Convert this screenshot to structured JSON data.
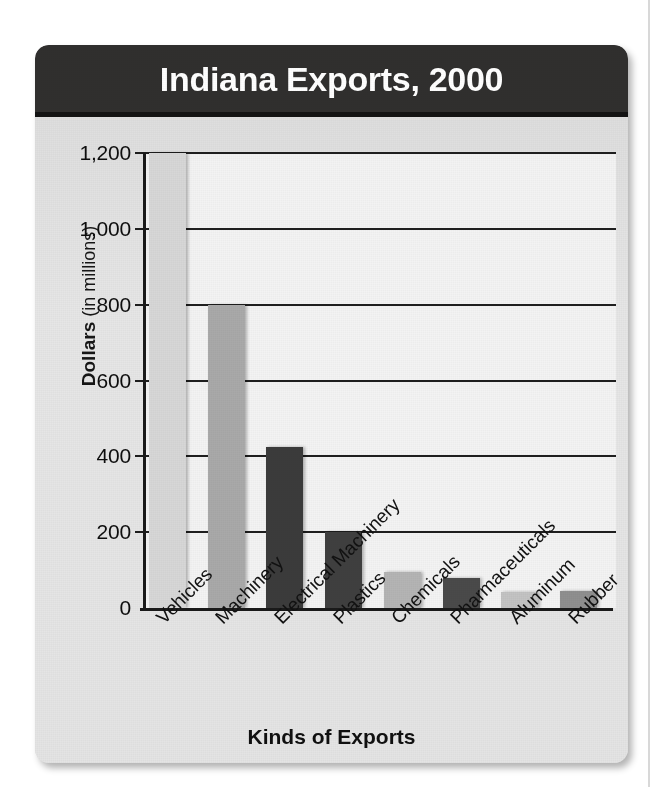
{
  "card": {
    "title": "Indiana Exports, 2000"
  },
  "chart_data": {
    "type": "bar",
    "title": "Indiana Exports, 2000",
    "xlabel": "Kinds of Exports",
    "ylabel": "Dollars (in millions)",
    "ylabel_strong": "Dollars",
    "ylabel_light": " (in millions)",
    "ylim": [
      0,
      1200
    ],
    "ytick_values": [
      0,
      200,
      400,
      600,
      800,
      1000,
      1200
    ],
    "ytick_labels": [
      "0",
      "200",
      "400",
      "600",
      "800",
      "1,000",
      "1,200"
    ],
    "grid": true,
    "legend": "none",
    "categories": [
      "Vehicles",
      "Machinery",
      "Electrical Machinery",
      "Plastics",
      "Chemicals",
      "Pharmaceuticals",
      "Aluminum",
      "Rubber"
    ],
    "values": [
      1200,
      800,
      425,
      200,
      95,
      80,
      42,
      45
    ],
    "bar_colors": [
      "#d7d7d7",
      "#a9a9a9",
      "#3b3b3b",
      "#3f3f3f",
      "#b4b4b4",
      "#4a4a4a",
      "#c3c3c3",
      "#8f8f8f"
    ]
  },
  "colors": {
    "title_bar": "#302f2e",
    "title_text": "#ffffff",
    "card_background": "#e2e2e2",
    "plot_background": "#f3f3f3",
    "gridline": "#1f1f1f",
    "axis": "#1a1a1a"
  }
}
